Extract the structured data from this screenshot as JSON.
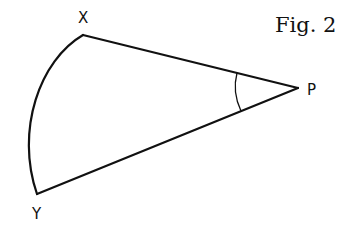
{
  "figure": {
    "title": "Fig. 2",
    "stroke_color": "#111111",
    "background": "#ffffff"
  },
  "points": {
    "X": {
      "label": "X",
      "x": 83,
      "y": 35
    },
    "Y": {
      "label": "Y",
      "x": 37,
      "y": 194
    },
    "P": {
      "label": "P",
      "x": 298,
      "y": 88
    }
  },
  "labels": {
    "X": "X",
    "Y": "Y",
    "P": "P"
  }
}
